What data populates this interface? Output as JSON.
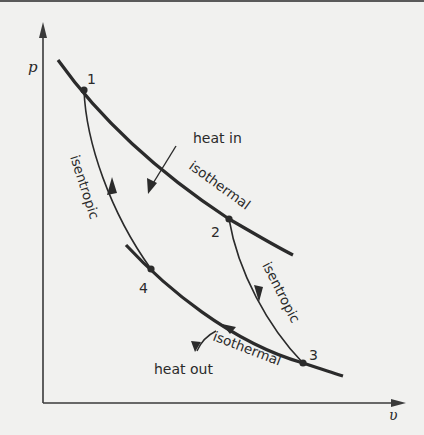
{
  "diagram": {
    "type": "p-v diagram (Carnot cycle)",
    "axes": {
      "y_label": "p",
      "x_label": "υ"
    },
    "points": [
      {
        "id": "1",
        "label": "1"
      },
      {
        "id": "2",
        "label": "2"
      },
      {
        "id": "3",
        "label": "3"
      },
      {
        "id": "4",
        "label": "4"
      }
    ],
    "processes": {
      "upper_isotherm": "isothermal",
      "lower_isotherm": "isothermal",
      "isentrope_left": "isentropic",
      "isentrope_right": "isentropic"
    },
    "annotations": {
      "heat_in": "heat in",
      "heat_out": "heat out"
    },
    "colors": {
      "line": "#2b2b2b",
      "background": "#f1f1ef"
    }
  }
}
